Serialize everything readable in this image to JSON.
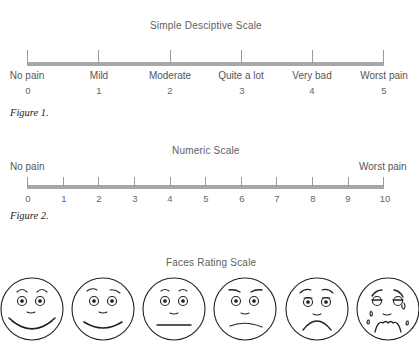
{
  "scales": {
    "descriptive": {
      "title": "Simple Desciptive Scale",
      "labels": [
        "No pain",
        "Mild",
        "Moderate",
        "Quite a lot",
        "Very bad",
        "Worst pain"
      ],
      "values": [
        "0",
        "1",
        "2",
        "3",
        "4",
        "5"
      ],
      "caption": "Figure 1."
    },
    "numeric": {
      "title": "Numeric Scale",
      "left_label": "No pain",
      "right_label": "Worst pain",
      "values": [
        "0",
        "1",
        "2",
        "3",
        "4",
        "5",
        "6",
        "7",
        "8",
        "9",
        "10"
      ],
      "caption": "Figure 2."
    },
    "faces": {
      "title": "Faces Rating Scale",
      "faces": [
        "very-happy-face-icon",
        "happy-face-icon",
        "neutral-face-icon",
        "slightly-sad-face-icon",
        "sad-face-icon",
        "crying-face-icon"
      ]
    }
  },
  "colors": {
    "bar": "#a8a8a8",
    "text": "#555555",
    "stroke": "#222222"
  }
}
